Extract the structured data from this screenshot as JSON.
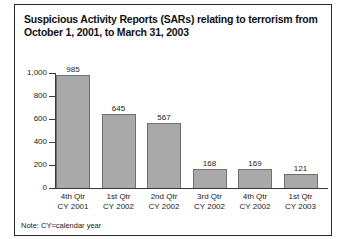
{
  "title": {
    "line1": "Suspicious Activity Reports (SARs) relating to terrorism from",
    "line2": "October 1, 2001, to March 31, 2003"
  },
  "note": "Note: CY=calendar year",
  "colors": {
    "bar_fill": "#a9a9a9",
    "bar_border": "#6f6f6f",
    "axis": "#3a3a3a",
    "frame": "#2b2b2b",
    "text": "#1a1a1a"
  },
  "chart_data": {
    "type": "bar",
    "title": "Suspicious Activity Reports (SARs) relating to terrorism from October 1, 2001, to March 31, 2003",
    "xlabel": "",
    "ylabel": "",
    "ylim": [
      0,
      1000
    ],
    "yticks": [
      0,
      200,
      400,
      600,
      800,
      1000
    ],
    "ytick_labels": [
      "0",
      "200",
      "400",
      "600",
      "800",
      "1,000"
    ],
    "grid": false,
    "legend": false,
    "data_labels": true,
    "categories": [
      {
        "line1": "4th Qtr",
        "line2": "CY 2001"
      },
      {
        "line1": "1st Qtr",
        "line2": "CY 2002"
      },
      {
        "line1": "2nd Qtr",
        "line2": "CY 2002"
      },
      {
        "line1": "3rd Qtr",
        "line2": "CY 2002"
      },
      {
        "line1": "4th Qtr",
        "line2": "CY 2002"
      },
      {
        "line1": "1st Qtr",
        "line2": "CY 2003"
      }
    ],
    "category_labels": [
      "4th Qtr CY 2001",
      "1st Qtr CY 2002",
      "2nd Qtr CY 2002",
      "3rd Qtr CY 2002",
      "4th Qtr CY 2002",
      "1st Qtr CY 2003"
    ],
    "values": [
      985,
      645,
      567,
      168,
      169,
      121
    ],
    "value_labels": [
      "985",
      "645",
      "567",
      "168",
      "169",
      "121"
    ]
  }
}
